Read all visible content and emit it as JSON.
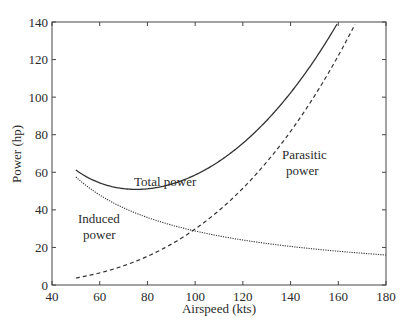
{
  "chart_data": {
    "type": "line",
    "title": "",
    "xlabel": "Airspeed (kts)",
    "ylabel": "Power (hp)",
    "xlim": [
      40,
      180
    ],
    "ylim": [
      0,
      140
    ],
    "xticks": [
      40,
      60,
      80,
      100,
      120,
      140,
      160,
      180
    ],
    "yticks": [
      0,
      20,
      40,
      60,
      80,
      100,
      120,
      140
    ],
    "grid": false,
    "legend": "none (inline annotations)",
    "series": [
      {
        "name": "Total power",
        "style": "solid",
        "x": [
          50,
          60,
          70,
          75,
          80,
          90,
          100,
          110,
          120,
          130,
          140,
          150,
          160
        ],
        "values": [
          61.2,
          54.4,
          51.3,
          50.9,
          51.2,
          53.7,
          58.6,
          65.8,
          75.5,
          87.6,
          102.3,
          119.8,
          140.0
        ]
      },
      {
        "name": "Induced power",
        "style": "dotted",
        "x": [
          50,
          60,
          70,
          80,
          90,
          100,
          110,
          120,
          130,
          140,
          150,
          160,
          170,
          180
        ],
        "values": [
          57.5,
          47.9,
          41.1,
          35.9,
          31.9,
          28.8,
          26.1,
          24.0,
          22.1,
          20.5,
          19.2,
          18.0,
          16.9,
          16.0
        ]
      },
      {
        "name": "Parasitic power",
        "style": "dashed",
        "x": [
          50,
          60,
          70,
          80,
          90,
          100,
          110,
          120,
          130,
          140,
          150,
          160,
          167
        ],
        "values": [
          3.7,
          6.4,
          10.2,
          15.3,
          21.7,
          29.8,
          39.7,
          51.5,
          65.5,
          81.8,
          100.6,
          122.0,
          140.0
        ]
      }
    ],
    "annotations": [
      {
        "text": "Total power",
        "x": 90,
        "y": 61
      },
      {
        "text": "Induced power",
        "x": 54,
        "y": 40
      },
      {
        "text": "Parasitic power",
        "x": 145,
        "y": 62
      }
    ]
  },
  "labels": {
    "xlabel": "Airspeed (kts)",
    "ylabel": "Power (hp)",
    "total_line1": "Total power",
    "induced_line1": "Induced",
    "induced_line2": "power",
    "parasitic_line1": "Parasitic",
    "parasitic_line2": "power"
  },
  "model": {
    "induced_k": 2875,
    "parasitic_c": 2.98e-05
  }
}
